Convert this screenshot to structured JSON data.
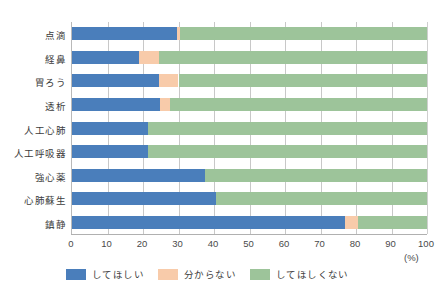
{
  "chart_data": {
    "type": "bar",
    "orientation": "horizontal",
    "stacked": true,
    "title": "",
    "xlabel": "(%)",
    "ylabel": "",
    "xlim": [
      0,
      100
    ],
    "xticks": [
      "0",
      "10",
      "20",
      "30",
      "40",
      "50",
      "60",
      "70",
      "80",
      "90",
      "100"
    ],
    "grid": "vertical",
    "legend_position": "bottom-left",
    "categories": [
      "点滴",
      "経鼻",
      "胃ろう",
      "透析",
      "人工心肺",
      "人工呼吸器",
      "強心薬",
      "心肺蘇生",
      "鎮静"
    ],
    "series": [
      {
        "name": "してほしい",
        "color": "#4a7ebb",
        "values": [
          29.6,
          19.0,
          24.5,
          24.8,
          21.5,
          21.5,
          37.5,
          40.5,
          77.0
        ]
      },
      {
        "name": "分からない",
        "color": "#f8cbaa",
        "values": [
          0.8,
          5.5,
          5.5,
          2.8,
          0.0,
          0.0,
          0.0,
          0.0,
          3.5
        ]
      },
      {
        "name": "してほしくない",
        "color": "#9dc49a",
        "values": [
          69.6,
          75.5,
          70.0,
          72.4,
          78.5,
          78.5,
          62.5,
          59.5,
          19.5
        ]
      }
    ]
  },
  "legend": {
    "items": [
      {
        "label": "してほしい",
        "color": "#4a7ebb"
      },
      {
        "label": "分からない",
        "color": "#f8cbaa"
      },
      {
        "label": "してほしくない",
        "color": "#9dc49a"
      }
    ]
  },
  "axis": {
    "unit": "(%)"
  }
}
